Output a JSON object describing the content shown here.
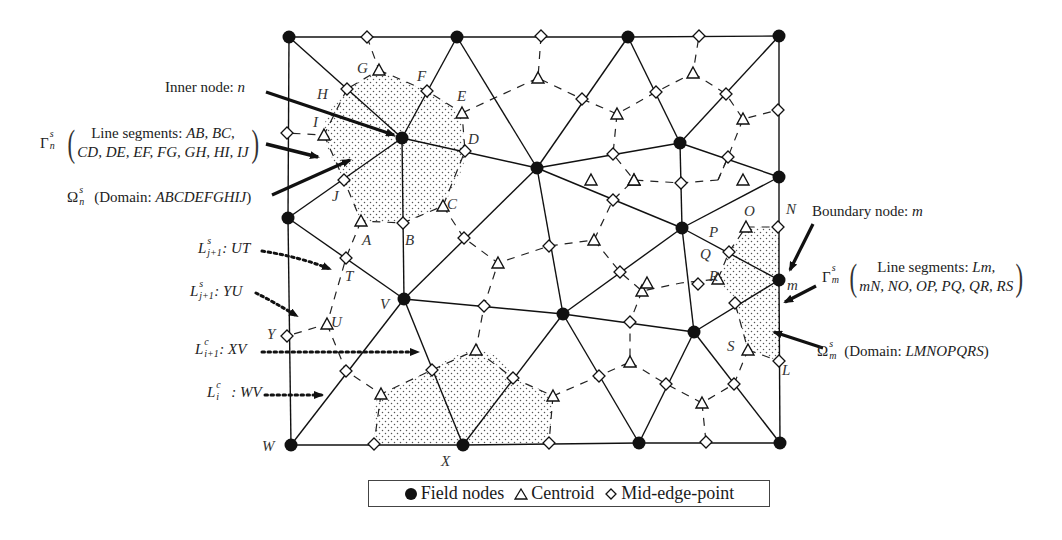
{
  "figure": {
    "annotations": {
      "inner_node": {
        "text": "Inner node: ",
        "var": "n"
      },
      "gamma_n": {
        "symbol": "Γ",
        "sup": "s",
        "sub": "n",
        "line1_prefix": "Line segments: ",
        "line1_items": "AB, BC,",
        "line2": "CD, DE, EF, FG, GH, HI, IJ"
      },
      "omega_n": {
        "symbol": "Ω",
        "sup": "s",
        "sub": "n",
        "prefix": "(Domain: ",
        "domain": "ABCDEFGHIJ",
        "suffix": ")"
      },
      "L_ut": {
        "symbol": "L",
        "sup": "s",
        "sub": "j+1",
        "text": ": UT"
      },
      "L_yu": {
        "symbol": "L",
        "sup": "s",
        "sub": "j+1",
        "text": ": YU"
      },
      "L_xv": {
        "symbol": "L",
        "sup": "c",
        "sub": "i+1",
        "text": ": XV"
      },
      "L_wv": {
        "symbol": "L",
        "sup": "c",
        "sub": "i",
        "text": ": WV"
      },
      "boundary_node": {
        "text": "Boundary node: ",
        "var": "m"
      },
      "gamma_m": {
        "symbol": "Γ",
        "sup": "s",
        "sub": "m",
        "line1_prefix": "Line segments: ",
        "line1_items": "Lm,",
        "line2": "mN, NO, OP, PQ, QR, RS"
      },
      "omega_m": {
        "symbol": "Ω",
        "sup": "s",
        "sub": "m",
        "prefix": "(Domain: ",
        "domain": "LMNOPQRS",
        "suffix": ")"
      }
    },
    "point_labels": [
      {
        "t": "G",
        "x": 357,
        "y": 60
      },
      {
        "t": "F",
        "x": 417,
        "y": 68
      },
      {
        "t": "E",
        "x": 457,
        "y": 88
      },
      {
        "t": "H",
        "x": 317,
        "y": 86
      },
      {
        "t": "I",
        "x": 313,
        "y": 114
      },
      {
        "t": "D",
        "x": 468,
        "y": 131
      },
      {
        "t": "J",
        "x": 332,
        "y": 188
      },
      {
        "t": "A",
        "x": 362,
        "y": 232
      },
      {
        "t": "B",
        "x": 405,
        "y": 232
      },
      {
        "t": "C",
        "x": 447,
        "y": 196
      },
      {
        "t": "T",
        "x": 345,
        "y": 268
      },
      {
        "t": "V",
        "x": 380,
        "y": 296
      },
      {
        "t": "U",
        "x": 331,
        "y": 314
      },
      {
        "t": "Y",
        "x": 267,
        "y": 326
      },
      {
        "t": "W",
        "x": 262,
        "y": 438
      },
      {
        "t": "X",
        "x": 441,
        "y": 453
      },
      {
        "t": "O",
        "x": 744,
        "y": 203
      },
      {
        "t": "N",
        "x": 786,
        "y": 201
      },
      {
        "t": "P",
        "x": 709,
        "y": 224
      },
      {
        "t": "Q",
        "x": 700,
        "y": 246
      },
      {
        "t": "m",
        "x": 787,
        "y": 277
      },
      {
        "t": "R",
        "x": 709,
        "y": 268
      },
      {
        "t": "S",
        "x": 727,
        "y": 338
      },
      {
        "t": "L",
        "x": 782,
        "y": 362
      }
    ],
    "field_nodes": [
      [
        289,
        37
      ],
      [
        457,
        37
      ],
      [
        628,
        37
      ],
      [
        779,
        36
      ],
      [
        402,
        138
      ],
      [
        537,
        168
      ],
      [
        680,
        143
      ],
      [
        779,
        177
      ],
      [
        288,
        218
      ],
      [
        682,
        228
      ],
      [
        779,
        280
      ],
      [
        404,
        299
      ],
      [
        563,
        314
      ],
      [
        694,
        332
      ],
      [
        291,
        445
      ],
      [
        463,
        445
      ],
      [
        639,
        443
      ],
      [
        780,
        443
      ]
    ],
    "edges": [
      [
        0,
        1
      ],
      [
        1,
        2
      ],
      [
        2,
        3
      ],
      [
        3,
        7
      ],
      [
        7,
        10
      ],
      [
        10,
        17
      ],
      [
        17,
        16
      ],
      [
        16,
        15
      ],
      [
        15,
        14
      ],
      [
        14,
        8
      ],
      [
        8,
        0
      ],
      [
        0,
        4
      ],
      [
        1,
        4
      ],
      [
        4,
        8
      ],
      [
        4,
        11
      ],
      [
        4,
        5
      ],
      [
        1,
        5
      ],
      [
        2,
        5
      ],
      [
        2,
        6
      ],
      [
        3,
        6
      ],
      [
        6,
        7
      ],
      [
        6,
        9
      ],
      [
        5,
        6
      ],
      [
        5,
        9
      ],
      [
        7,
        9
      ],
      [
        9,
        10
      ],
      [
        10,
        13
      ],
      [
        9,
        13
      ],
      [
        9,
        12
      ],
      [
        5,
        12
      ],
      [
        5,
        11
      ],
      [
        8,
        11
      ],
      [
        11,
        14
      ],
      [
        11,
        15
      ],
      [
        11,
        12
      ],
      [
        12,
        15
      ],
      [
        12,
        16
      ],
      [
        12,
        13
      ],
      [
        13,
        16
      ],
      [
        13,
        17
      ]
    ],
    "mid_edge_points": [
      [
        367,
        37
      ],
      [
        541,
        36
      ],
      [
        699,
        36
      ],
      [
        347,
        89
      ],
      [
        427,
        91
      ],
      [
        287,
        133
      ],
      [
        465,
        151
      ],
      [
        582,
        99
      ],
      [
        656,
        92
      ],
      [
        726,
        94
      ],
      [
        778,
        110
      ],
      [
        613,
        154
      ],
      [
        613,
        200
      ],
      [
        728,
        157
      ],
      [
        344,
        180
      ],
      [
        403,
        223
      ],
      [
        464,
        238
      ],
      [
        549,
        246
      ],
      [
        620,
        272
      ],
      [
        778,
        227
      ],
      [
        729,
        252
      ],
      [
        735,
        303
      ],
      [
        346,
        258
      ],
      [
        484,
        306
      ],
      [
        630,
        322
      ],
      [
        779,
        361
      ],
      [
        287,
        336
      ],
      [
        346,
        371
      ],
      [
        432,
        370
      ],
      [
        513,
        378
      ],
      [
        599,
        376
      ],
      [
        666,
        384
      ],
      [
        734,
        384
      ],
      [
        374,
        444
      ],
      [
        549,
        443
      ],
      [
        706,
        442
      ],
      [
        681,
        183
      ],
      [
        698,
        284
      ]
    ],
    "centroids": [
      [
        379,
        70
      ],
      [
        538,
        78
      ],
      [
        693,
        73
      ],
      [
        462,
        113
      ],
      [
        617,
        114
      ],
      [
        743,
        119
      ],
      [
        324,
        135
      ],
      [
        634,
        180
      ],
      [
        634,
        180
      ],
      [
        443,
        206
      ],
      [
        361,
        221
      ],
      [
        594,
        240
      ],
      [
        498,
        263
      ],
      [
        642,
        291
      ],
      [
        746,
        227
      ],
      [
        718,
        279
      ],
      [
        748,
        350
      ],
      [
        327,
        324
      ],
      [
        476,
        350
      ],
      [
        630,
        362
      ],
      [
        702,
        403
      ],
      [
        381,
        394
      ],
      [
        553,
        396
      ],
      [
        591,
        180
      ],
      [
        743,
        180
      ],
      [
        647,
        283
      ]
    ],
    "legend": {
      "field_nodes": "Field nodes",
      "centroid": "Centroid",
      "mid_edge": "Mid-edge-point"
    },
    "colors": {
      "ink": "#111111",
      "stipple": "#555555",
      "background": "#ffffff"
    }
  }
}
